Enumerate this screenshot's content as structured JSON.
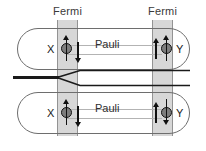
{
  "figure": {
    "type": "physics-schematic"
  },
  "reservoirs": [
    {
      "id": "left",
      "label": "Fermi"
    },
    {
      "id": "right",
      "label": "Fermi"
    }
  ],
  "regions": [
    {
      "id": "top",
      "label": "Pauli",
      "left_site": {
        "label": "X",
        "spin": "up",
        "side_spin": "down"
      },
      "right_site": {
        "label": "Y",
        "spin": "up",
        "side_spin": "up"
      }
    },
    {
      "id": "bottom",
      "label": "Pauli",
      "left_site": {
        "label": "X",
        "spin": "up",
        "side_spin": "down"
      },
      "right_site": {
        "label": "Y",
        "spin": "down",
        "side_spin": "up"
      }
    }
  ],
  "beam": {
    "label": "incoming beam",
    "branches": 2
  },
  "colors": {
    "band_fill": "#d4d4d4",
    "band_border": "#8a8a8a",
    "outline": "#6e6e6e",
    "dot_fill": "#7d7d7d",
    "dot_border": "#111111",
    "rail": "#b3b3b3",
    "beam": "#1a1a1a",
    "text": "#2f2f2f",
    "background": "#ffffff"
  }
}
